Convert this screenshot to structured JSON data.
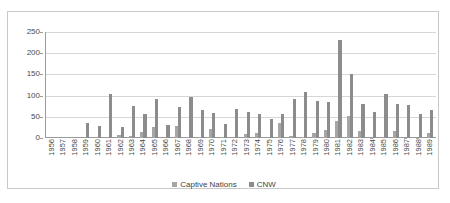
{
  "chart_data": {
    "type": "bar",
    "title": "",
    "subtitle": "",
    "xlabel": "",
    "ylabel": "",
    "ylim": [
      0,
      250
    ],
    "yticks": [
      0,
      50,
      100,
      150,
      200,
      250
    ],
    "grid": true,
    "legend_position": "bottom",
    "categories": [
      "1956",
      "1957",
      "1958",
      "1959",
      "1960",
      "1961",
      "1962",
      "1963",
      "1964",
      "1965",
      "1966",
      "1967",
      "1968",
      "1969",
      "1970",
      "1971",
      "1972",
      "1973",
      "1974",
      "1975",
      "1976",
      "1977",
      "1978",
      "1979",
      "1980",
      "1981",
      "1982",
      "1983",
      "1984",
      "1985",
      "1986",
      "1987",
      "1988",
      "1989"
    ],
    "series": [
      {
        "name": "Captive Nations",
        "color": "#a6a6a6",
        "values": [
          0,
          0,
          0,
          0,
          0,
          0,
          8,
          5,
          15,
          25,
          0,
          28,
          2,
          3,
          22,
          2,
          0,
          9,
          13,
          0,
          36,
          4,
          2,
          11,
          19,
          40,
          51,
          17,
          1,
          0,
          17,
          1,
          1,
          11
        ]
      },
      {
        "name": "CNW",
        "color": "#8c8c8c",
        "values": [
          0,
          0,
          0,
          35,
          28,
          104,
          25,
          76,
          57,
          91,
          31,
          74,
          96,
          67,
          60,
          33,
          69,
          61,
          56,
          45,
          56,
          91,
          108,
          88,
          86,
          231,
          152,
          80,
          61,
          104,
          80,
          78,
          57,
          66
        ]
      }
    ]
  },
  "legend": {
    "items": [
      {
        "label": "Captive Nations",
        "marker": "legend-swatch-captive-nations"
      },
      {
        "label": "CNW",
        "marker": "legend-swatch-cnw"
      }
    ]
  },
  "colors": {
    "series_captive_nations": "#a6a6a6",
    "series_cnw": "#8c8c8c",
    "gridline": "#d6d6d6",
    "axis": "#9a9a9a",
    "frame": "#c9c9c9",
    "text": "#4a4a4a",
    "background": "#ffffff"
  }
}
